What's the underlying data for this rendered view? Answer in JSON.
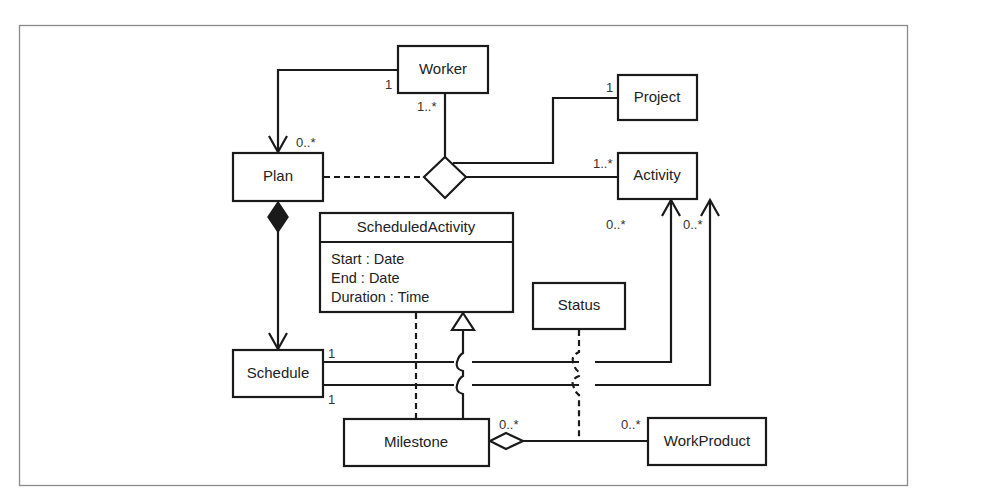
{
  "diagram": {
    "type": "UML class diagram",
    "classes": {
      "worker": {
        "name": "Worker"
      },
      "project": {
        "name": "Project"
      },
      "plan": {
        "name": "Plan"
      },
      "activity": {
        "name": "Activity"
      },
      "scheduled_activity": {
        "name": "ScheduledActivity",
        "attributes": [
          "Start : Date",
          "End : Date",
          "Duration : Time"
        ]
      },
      "status": {
        "name": "Status"
      },
      "schedule": {
        "name": "Schedule"
      },
      "milestone": {
        "name": "Milestone"
      },
      "work_product": {
        "name": "WorkProduct"
      }
    },
    "multiplicities": {
      "worker_plan_worker_end": "1",
      "worker_plan_plan_end": "0..*",
      "worker_assoc_end": "1..*",
      "project_assoc_end": "1",
      "activity_assoc_end": "1..*",
      "schedule_activity_1_schedule_end": "1",
      "schedule_activity_1_activity_end": "0..*",
      "schedule_activity_2_schedule_end": "1",
      "schedule_activity_2_activity_end": "0..*",
      "milestone_workproduct_milestone_end": "0..*",
      "milestone_workproduct_workproduct_end": "0..*"
    },
    "relationships": [
      {
        "from": "Worker",
        "to": "Plan",
        "kind": "directed association"
      },
      {
        "from": "Worker",
        "to": "n-ary association diamond",
        "kind": "association"
      },
      {
        "from": "Project",
        "to": "n-ary association diamond",
        "kind": "association"
      },
      {
        "from": "Activity",
        "to": "n-ary association diamond",
        "kind": "association"
      },
      {
        "from": "Plan",
        "to": "n-ary association diamond",
        "kind": "association class (dashed)"
      },
      {
        "from": "Plan",
        "to": "Schedule",
        "kind": "composition"
      },
      {
        "from": "Schedule",
        "to": "Activity",
        "kind": "directed association (x2)"
      },
      {
        "from": "Milestone",
        "to": "ScheduledActivity",
        "kind": "generalization"
      },
      {
        "from": "Milestone",
        "to": "ScheduledActivity",
        "kind": "dashed dependency"
      },
      {
        "from": "Milestone",
        "to": "WorkProduct",
        "kind": "aggregation"
      },
      {
        "from": "Status",
        "to": "Milestone-WorkProduct association",
        "kind": "association class (dashed)"
      }
    ]
  }
}
